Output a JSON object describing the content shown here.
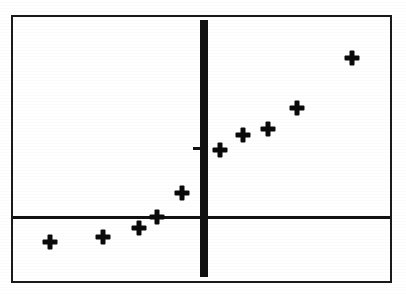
{
  "figure": {
    "background_color": "#ffffff",
    "frame_color": "#1a1a1a",
    "axis_color": "#111111",
    "marker_color": "#0a0a0a",
    "frame": {
      "left": 11,
      "top": 15,
      "width": 381,
      "height": 268
    }
  },
  "axes": {
    "horizontal": {
      "y": 217,
      "x_start": 13,
      "x_end": 390,
      "thickness": 3
    },
    "vertical": {
      "x": 200,
      "y_start": 20,
      "y_end": 277,
      "thickness": 8
    },
    "tick": {
      "x": 193,
      "y": 147,
      "width": 7,
      "height": 3
    }
  },
  "chart_data": {
    "type": "scatter",
    "title": "",
    "subtitle": "",
    "xlabel": "",
    "ylabel": "",
    "grid": false,
    "legend": false,
    "marker_symbol": "+",
    "axis_style": "origin-cross",
    "xlim": [
      -8.2,
      8.3
    ],
    "ylim": [
      -4.5,
      7.8
    ],
    "x_origin_px": 204,
    "y_origin_px": 217,
    "px_per_x_unit": 23.0,
    "px_per_y_unit": 23.0,
    "points": [
      {
        "label": "p1",
        "x": -6.7,
        "y": -1.1,
        "px": 50,
        "py": 242
      },
      {
        "label": "p2",
        "x": -4.4,
        "y": -0.9,
        "px": 103,
        "py": 237
      },
      {
        "label": "p3",
        "x": -2.8,
        "y": -0.5,
        "px": 139,
        "py": 228
      },
      {
        "label": "p4",
        "x": -2.0,
        "y": 0.0,
        "px": 157,
        "py": 217
      },
      {
        "label": "p5",
        "x": -1.0,
        "y": 1.0,
        "px": 182,
        "py": 193
      },
      {
        "label": "p6",
        "x": 0.7,
        "y": 2.9,
        "px": 220,
        "py": 150
      },
      {
        "label": "p7",
        "x": 1.7,
        "y": 3.6,
        "px": 243,
        "py": 135
      },
      {
        "label": "p8",
        "x": 2.8,
        "y": 3.8,
        "px": 268,
        "py": 129
      },
      {
        "label": "p9",
        "x": 4.0,
        "y": 4.7,
        "px": 297,
        "py": 108
      },
      {
        "label": "p10",
        "x": 6.4,
        "y": 6.9,
        "px": 352,
        "py": 58
      }
    ],
    "series": [
      {
        "name": "data",
        "x": [
          -6.7,
          -4.4,
          -2.8,
          -2.0,
          -1.0,
          0.7,
          1.7,
          2.8,
          4.0,
          6.4
        ],
        "y": [
          -1.1,
          -0.9,
          -0.5,
          0.0,
          1.0,
          2.9,
          3.6,
          3.8,
          4.7,
          6.9
        ]
      }
    ]
  }
}
